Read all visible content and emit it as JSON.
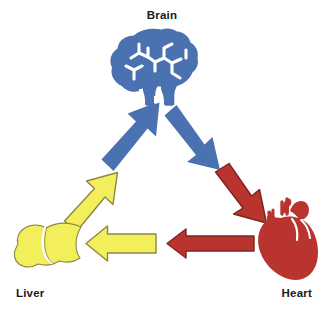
{
  "diagram": {
    "type": "cycle-diagram",
    "background_color": "#FFFFFF",
    "nodes": [
      {
        "id": "brain",
        "label": "Brain",
        "icon": "brain-icon",
        "color": "#4A72B0",
        "position": "top-center"
      },
      {
        "id": "heart",
        "label": "Heart",
        "icon": "heart-icon",
        "color": "#B9342E",
        "position": "bottom-right"
      },
      {
        "id": "liver",
        "label": "Liver",
        "icon": "liver-icon",
        "color": "#F3EE5C",
        "position": "bottom-left"
      }
    ],
    "arrows": [
      {
        "id": "liver-to-brain-blue",
        "icon": "arrow-up-right-icon",
        "from": "liver",
        "to": "brain",
        "color": "#4A72B0",
        "outline": "none",
        "direction": "up-right"
      },
      {
        "id": "brain-to-heart-blue",
        "icon": "arrow-down-right-icon",
        "from": "brain",
        "to": "heart",
        "color": "#4A72B0",
        "outline": "none",
        "direction": "down-right"
      },
      {
        "id": "brain-to-heart-red",
        "icon": "arrow-down-right-icon",
        "from": "brain",
        "to": "heart",
        "color": "#B9342E",
        "outline": "#7E2420",
        "direction": "down-right"
      },
      {
        "id": "heart-to-liver-red",
        "icon": "arrow-left-icon",
        "from": "heart",
        "to": "liver",
        "color": "#B9342E",
        "outline": "#7E2420",
        "direction": "left"
      },
      {
        "id": "heart-to-liver-yellow",
        "icon": "arrow-left-icon",
        "from": "heart",
        "to": "liver",
        "color": "#F3EE5C",
        "outline": "#8C8742",
        "direction": "left"
      },
      {
        "id": "liver-to-brain-yellow",
        "icon": "arrow-up-right-icon",
        "from": "liver",
        "to": "brain",
        "color": "#F3EE5C",
        "outline": "#8C8742",
        "direction": "up-right"
      }
    ]
  },
  "colors": {
    "blue": "#4A72B0",
    "red": "#B9342E",
    "red_outline": "#7E2420",
    "yellow": "#F3EE5C",
    "yellow_outline": "#8C8742",
    "label_text": "#1A1A1A",
    "icon_highlight": "#FFFFFF"
  }
}
